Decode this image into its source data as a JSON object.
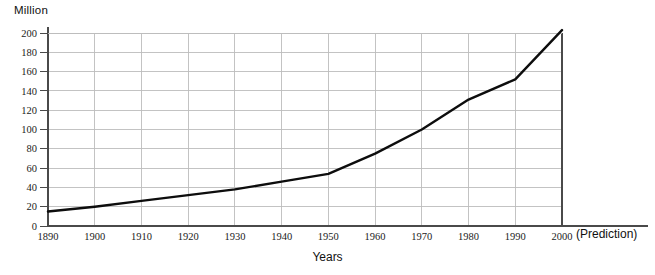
{
  "chart_data": {
    "type": "line",
    "title": "",
    "subtitle": "",
    "xlabel": "Years",
    "ylabel": "Million",
    "x": [
      1890,
      1900,
      1910,
      1920,
      1930,
      1940,
      1950,
      1960,
      1970,
      1980,
      1990,
      2000
    ],
    "categories": [
      "1890",
      "1900",
      "1910",
      "1920",
      "1930",
      "1940",
      "1950",
      "1960",
      "1970",
      "1980",
      "1990",
      "2000"
    ],
    "values": [
      15,
      20,
      26,
      32,
      38,
      46,
      54,
      75,
      100,
      131,
      152,
      203
    ],
    "series": [
      {
        "name": "Population",
        "values": [
          15,
          20,
          26,
          32,
          38,
          46,
          54,
          75,
          100,
          131,
          152,
          203
        ]
      }
    ],
    "xlim": [
      1890,
      2000
    ],
    "ylim": [
      0,
      200
    ],
    "y_ticks": [
      0,
      20,
      40,
      60,
      80,
      100,
      120,
      140,
      160,
      180,
      200
    ],
    "y_tick_labels": [
      "0",
      "20",
      "40",
      "60",
      "80",
      "100",
      "120",
      "140",
      "160",
      "180",
      "200"
    ],
    "x_ticks": [
      1890,
      1900,
      1910,
      1920,
      1930,
      1940,
      1950,
      1960,
      1970,
      1980,
      1990,
      2000
    ],
    "x_tick_labels": [
      "1890",
      "1900",
      "1910",
      "1920",
      "1930",
      "1940",
      "1950",
      "1960",
      "1970",
      "1980",
      "1990",
      "2000"
    ],
    "grid": true,
    "legend": false,
    "legend_position": "none",
    "annotations": [
      {
        "text": "(Prediction)",
        "anchor_x": 2000,
        "position": "right-of-axis"
      }
    ],
    "colors": {
      "line": "#0d0d0d",
      "grid": "#bcbcbc",
      "axis": "#4a4a4a",
      "background": "#ffffff",
      "text": "#1b1b1b"
    }
  },
  "axis": {
    "y_unit_caption": "Million",
    "x_title": "Years"
  },
  "notes": {
    "prediction": "(Prediction)"
  }
}
